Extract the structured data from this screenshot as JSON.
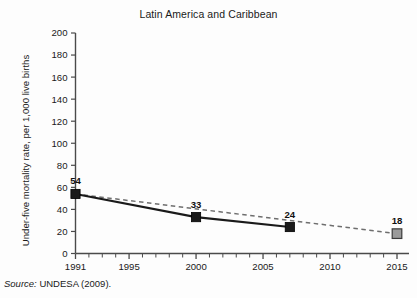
{
  "chart_data": {
    "type": "line",
    "title": "Latin America and Caribbean",
    "xlabel": "",
    "ylabel": "Under-five mortality rate, per 1,000 live births",
    "xlim": [
      1991,
      2015
    ],
    "ylim": [
      0,
      200
    ],
    "ytick_step": 20,
    "yticks": [
      0,
      20,
      40,
      60,
      80,
      100,
      120,
      140,
      160,
      180,
      200
    ],
    "ytick_labels": [
      "0",
      "20",
      "40",
      "60",
      "80",
      "100",
      "120",
      "140",
      "160",
      "180",
      "200"
    ],
    "xticks_labeled": [
      1991,
      1995,
      2000,
      2005,
      2010,
      2015
    ],
    "xtick_labels": [
      "1991",
      "1995",
      "2000",
      "2005",
      "2010",
      "2015"
    ],
    "xticks_minor_every": 1,
    "grid": false,
    "legend": "none",
    "series": [
      {
        "name": "Observed under-five mortality rate",
        "style": "solid",
        "color": "#1a1a1a",
        "marker": "square-filled",
        "x": [
          1991,
          2000,
          2007
        ],
        "values": [
          54,
          33,
          24
        ],
        "data_labels": [
          "54",
          "33",
          "24"
        ]
      },
      {
        "name": "Target trend to 2015",
        "style": "dashed",
        "color": "#6e6e6e",
        "marker": "square-grey",
        "x": [
          1991,
          2015
        ],
        "values": [
          54,
          18
        ],
        "data_labels": [
          "18"
        ]
      }
    ],
    "annotations": [
      {
        "text": "54",
        "x": 1991,
        "y": 54
      },
      {
        "text": "33",
        "x": 2000,
        "y": 33
      },
      {
        "text": "24",
        "x": 2007,
        "y": 24
      },
      {
        "text": "18",
        "x": 2015,
        "y": 18
      }
    ]
  },
  "source": {
    "label": "Source:",
    "text": "UNDESA (2009)."
  },
  "colors": {
    "series_solid": "#1a1a1a",
    "series_dashed": "#6e6e6e",
    "target_marker_fill": "#9a9a9a",
    "axis": "#4a4a4a",
    "text": "#1a1a1a",
    "background": "#fdfdfd"
  }
}
